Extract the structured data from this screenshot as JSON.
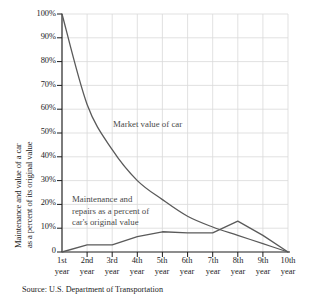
{
  "chart_data": {
    "type": "line",
    "title": "",
    "subtitle": "",
    "xlabel": "",
    "ylabel": "Maintenance and value of a car as a percent of its original value",
    "ylabel_lines": [
      "Maintenance and value of a car",
      "as a percent of its original value"
    ],
    "categories": [
      "1st year",
      "2nd year",
      "3rd year",
      "4th year",
      "5th year",
      "6th year",
      "7th year",
      "8th year",
      "9th year",
      "10th year"
    ],
    "x": [
      1,
      2,
      3,
      4,
      5,
      6,
      7,
      8,
      9,
      10
    ],
    "ylim": [
      0,
      100
    ],
    "xlim": [
      1,
      10
    ],
    "yticks": [
      0,
      10,
      20,
      30,
      40,
      50,
      60,
      70,
      80,
      90,
      100
    ],
    "ytick_labels": [
      "0",
      "10%",
      "20%",
      "30%",
      "40%",
      "50%",
      "60%",
      "70%",
      "80%",
      "90%",
      "100%"
    ],
    "grid": true,
    "legend": "none",
    "series": [
      {
        "name": "Market value of car",
        "values": [
          100,
          62,
          43,
          30,
          22,
          15,
          10.5,
          7,
          3.5,
          0
        ],
        "color": "#5a5a5a",
        "style": "smooth-decay"
      },
      {
        "name": "Maintenance and repairs as a percent of car's original value",
        "values": [
          0,
          3,
          3,
          6.5,
          8.5,
          8,
          8,
          13,
          7,
          0
        ],
        "color": "#5a5a5a",
        "style": "piecewise-linear"
      }
    ],
    "annotations": [
      {
        "id": "market",
        "lines": [
          "Market value of car"
        ]
      },
      {
        "id": "maintenance",
        "lines": [
          "Maintenance and",
          "repairs as a percent of",
          "car's original value"
        ]
      }
    ],
    "source": "Source: U.S. Department of Transportation",
    "colors": {
      "axis": "#1c1c1c",
      "grid": "#d9d9d9",
      "curve": "#595959",
      "annotation_text": "#4a4a4a",
      "background": "#ffffff"
    }
  },
  "yticks": {
    "t100": "100%",
    "t90": "90%",
    "t80": "80%",
    "t70": "70%",
    "t60": "60%",
    "t50": "50%",
    "t40": "40%",
    "t30": "30%",
    "t20": "20%",
    "t10": "10%",
    "t0": "0"
  },
  "xticks": [
    {
      "ord": "1st",
      "unit": "year"
    },
    {
      "ord": "2nd",
      "unit": "year"
    },
    {
      "ord": "3rd",
      "unit": "year"
    },
    {
      "ord": "4th",
      "unit": "year"
    },
    {
      "ord": "5th",
      "unit": "year"
    },
    {
      "ord": "6th",
      "unit": "year"
    },
    {
      "ord": "7th",
      "unit": "year"
    },
    {
      "ord": "8th",
      "unit": "year"
    },
    {
      "ord": "9th",
      "unit": "year"
    },
    {
      "ord": "10th",
      "unit": "year"
    }
  ],
  "annotations": {
    "market_value": "Market value of car",
    "maintenance_l1": "Maintenance and",
    "maintenance_l2": "repairs as a percent of",
    "maintenance_l3": "car's original value"
  },
  "ylabel": {
    "line1": "Maintenance and value of a car",
    "line2": "as a percent of its original value"
  },
  "source": "Source: U.S. Department of Transportation"
}
